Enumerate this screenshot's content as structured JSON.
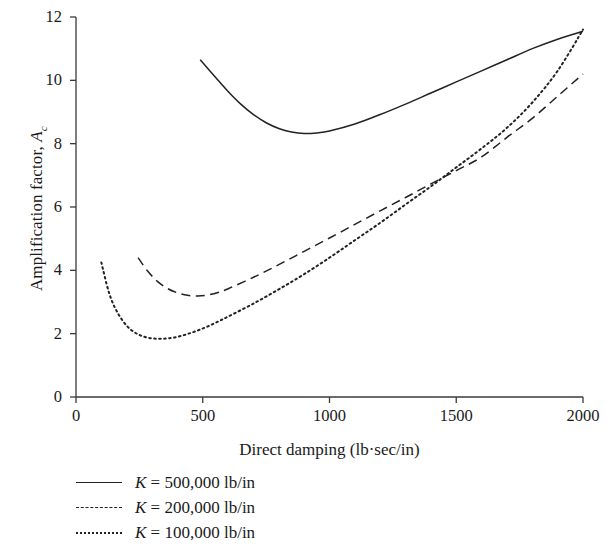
{
  "chart_data": {
    "type": "line",
    "title": "",
    "xlabel": "Direct damping (lb·sec/in)",
    "ylabel": "Amplification factor, A",
    "ylabel_sub": "c",
    "xlim": [
      0,
      2000
    ],
    "ylim": [
      0,
      12
    ],
    "xticks": [
      "0",
      "500",
      "1000",
      "1500",
      "2000"
    ],
    "xtick_values": [
      0,
      500,
      1000,
      1500,
      2000
    ],
    "yticks": [
      "0",
      "2",
      "4",
      "6",
      "8",
      "10",
      "12"
    ],
    "ytick_values": [
      0,
      2,
      4,
      6,
      8,
      10,
      12
    ],
    "grid": false,
    "legend_position": "below-axis-left",
    "series": [
      {
        "name": "K = 500,000 lb/in",
        "style": "solid",
        "color": "#222222",
        "x": [
          490,
          550,
          600,
          650,
          700,
          750,
          800,
          850,
          900,
          950,
          1000,
          1100,
          1200,
          1300,
          1400,
          1500,
          1600,
          1700,
          1800,
          1900,
          2000
        ],
        "y": [
          10.65,
          10.1,
          9.65,
          9.25,
          8.92,
          8.66,
          8.48,
          8.37,
          8.32,
          8.34,
          8.4,
          8.62,
          8.92,
          9.25,
          9.6,
          9.95,
          10.3,
          10.65,
          11.0,
          11.3,
          11.55
        ]
      },
      {
        "name": "K = 200,000 lb/in",
        "style": "dashed",
        "color": "#222222",
        "x": [
          245,
          280,
          320,
          360,
          400,
          440,
          480,
          520,
          560,
          600,
          700,
          800,
          900,
          1000,
          1100,
          1200,
          1300,
          1400,
          1500,
          1600,
          1700,
          1800,
          1900,
          2000
        ],
        "y": [
          4.4,
          4.0,
          3.66,
          3.43,
          3.29,
          3.21,
          3.19,
          3.22,
          3.3,
          3.42,
          3.78,
          4.18,
          4.6,
          5.02,
          5.45,
          5.88,
          6.3,
          6.73,
          7.15,
          7.58,
          8.2,
          8.8,
          9.5,
          10.2
        ]
      },
      {
        "name": "K = 100,000 lb/in",
        "style": "dotted",
        "color": "#222222",
        "x": [
          100,
          130,
          160,
          200,
          240,
          280,
          320,
          360,
          400,
          440,
          480,
          520,
          560,
          600,
          700,
          800,
          900,
          1000,
          1100,
          1200,
          1300,
          1400,
          1500,
          1600,
          1700,
          1800,
          1900,
          2000
        ],
        "y": [
          4.25,
          3.3,
          2.72,
          2.25,
          2.0,
          1.88,
          1.84,
          1.85,
          1.9,
          1.99,
          2.1,
          2.23,
          2.38,
          2.54,
          2.95,
          3.4,
          3.88,
          4.4,
          4.95,
          5.5,
          6.08,
          6.65,
          7.25,
          7.85,
          8.5,
          9.3,
          10.3,
          11.6
        ]
      }
    ]
  },
  "axis": {
    "y_title_text": "Amplification factor, ",
    "y_title_var": "A",
    "y_title_sub": "c",
    "x_title": "Direct damping (lb·sec/in)"
  },
  "legend": {
    "items": [
      {
        "key": "solid",
        "var": "K",
        "text": " = 500,000 lb/in"
      },
      {
        "key": "dashed",
        "var": "K",
        "text": " = 200,000 lb/in"
      },
      {
        "key": "dotted",
        "var": "K",
        "text": " = 100,000 lb/in"
      }
    ]
  }
}
